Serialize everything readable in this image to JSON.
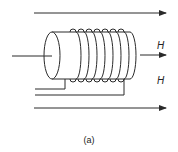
{
  "figure": {
    "caption": "(a)",
    "field_label_top": "H",
    "field_label_bottom": "H",
    "stroke_color": "#2a2a2a",
    "coil_turns": 7,
    "elements": [
      "solenoid-coil-on-cylindrical-core",
      "axial-input-wire",
      "field-arrow-top",
      "field-arrow-middle",
      "field-arrow-bottom",
      "lead-wire-1",
      "lead-wire-2"
    ]
  }
}
